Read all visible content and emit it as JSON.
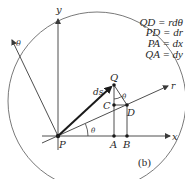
{
  "figure": {
    "caption": "(b)",
    "equations": [
      "QD = rdθ",
      "PD = dr",
      "PA = dx",
      "QA = dy"
    ],
    "axes": {
      "x_label": "x",
      "y_label": "y",
      "r_label": "r",
      "theta_label": "θ"
    },
    "points": {
      "P": "P",
      "Q": "Q",
      "C": "C",
      "D": "D",
      "A": "A",
      "B": "B"
    },
    "vector_label": "ds",
    "angle_label_origin": "θ",
    "angle_label_q": "θ",
    "colors": {
      "stroke": "#3a3a3a",
      "circle": "#6a6a6a",
      "text": "#2a2a2a"
    }
  }
}
